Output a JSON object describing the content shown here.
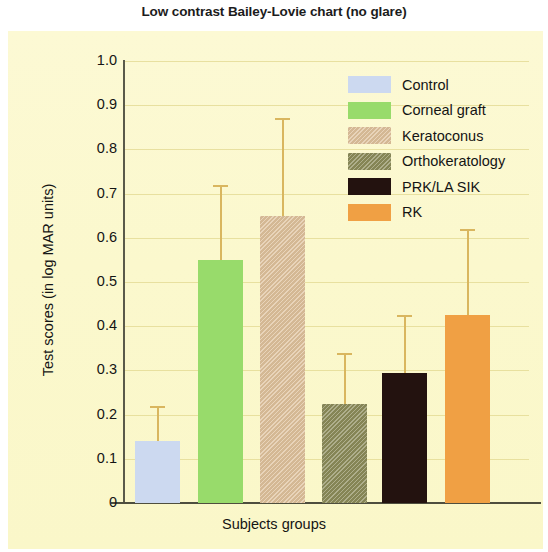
{
  "chart_data": {
    "type": "bar",
    "title": "Low contrast Bailey-Lovie chart (no glare)",
    "xlabel": "Subjects groups",
    "ylabel": "Test scores (in log MAR units)",
    "ylim": [
      0,
      1.0
    ],
    "ytick_labels": [
      "1.0",
      "0.9",
      "0.8",
      "0.7",
      "0.6",
      "0.5",
      "0.4",
      "0.3",
      "0.2",
      "0.1",
      "0"
    ],
    "ytick_values": [
      1.0,
      0.9,
      0.8,
      0.7,
      0.6,
      0.5,
      0.4,
      0.3,
      0.2,
      0.1,
      0
    ],
    "grid": true,
    "legend_position": "upper right",
    "categories": [
      "Control",
      "Corneal graft",
      "Keratoconus",
      "Orthokeratology",
      "PRK/LA SIK",
      "RK"
    ],
    "values": [
      0.14,
      0.55,
      0.65,
      0.225,
      0.295,
      0.425
    ],
    "error_upper": [
      0.22,
      0.72,
      0.87,
      0.34,
      0.425,
      0.62
    ],
    "colors": [
      "#ccd9f0",
      "#98db6b",
      "#dfc29c",
      "#8c8c5a",
      "#23120f",
      "#f0a044"
    ],
    "series": [
      {
        "name": "Test scores",
        "points": [
          {
            "label": "Control",
            "value": 0.14,
            "error_top": 0.22,
            "color": "#ccd9f0",
            "textured": false
          },
          {
            "label": "Corneal graft",
            "value": 0.55,
            "error_top": 0.72,
            "color": "#98db6b",
            "textured": false
          },
          {
            "label": "Keratoconus",
            "value": 0.65,
            "error_top": 0.87,
            "color": "#dfc29c",
            "textured": true
          },
          {
            "label": "Orthokeratology",
            "value": 0.225,
            "error_top": 0.34,
            "color": "#8c8c5a",
            "textured": true
          },
          {
            "label": "PRK/LA SIK",
            "value": 0.295,
            "error_top": 0.425,
            "color": "#23120f",
            "textured": false
          },
          {
            "label": "RK",
            "value": 0.425,
            "error_top": 0.62,
            "color": "#f0a044",
            "textured": false
          }
        ]
      }
    ]
  },
  "legend": {
    "items": [
      {
        "label": "Control",
        "color": "#ccd9f0",
        "textured": false
      },
      {
        "label": "Corneal graft",
        "color": "#98db6b",
        "textured": false
      },
      {
        "label": "Keratoconus",
        "color": "#dfc29c",
        "textured": true
      },
      {
        "label": "Orthokeratology",
        "color": "#8c8c5a",
        "textured": true
      },
      {
        "label": "PRK/LA SIK",
        "color": "#23120f",
        "textured": false
      },
      {
        "label": "RK",
        "color": "#f0a044",
        "textured": false
      }
    ]
  },
  "style": {
    "panel_background": "#fbf8cf",
    "errorbar_color": "#d9b65f",
    "axis_color": "#4e4e3e",
    "text_color": "#141414"
  }
}
